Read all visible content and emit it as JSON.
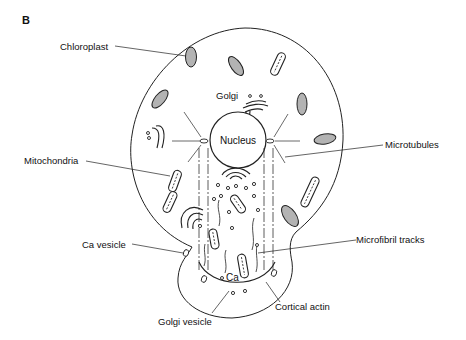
{
  "figure": {
    "panel_label": "B",
    "labels": {
      "chloroplast": "Chloroplast",
      "golgi": "Golgi",
      "nucleus": "Nucleus",
      "mitochondria": "Mitochondria",
      "microtubules": "Microtubules",
      "ca_vesicle": "Ca vesicle",
      "microfibril_tracks": "Microfibril tracks",
      "ca": "Ca",
      "golgi_vesicle": "Golgi vesicle",
      "cortical_actin": "Cortical actin"
    },
    "colors": {
      "chloroplast_fill": "#b3b3b3",
      "line": "#222222",
      "background": "#ffffff"
    }
  }
}
